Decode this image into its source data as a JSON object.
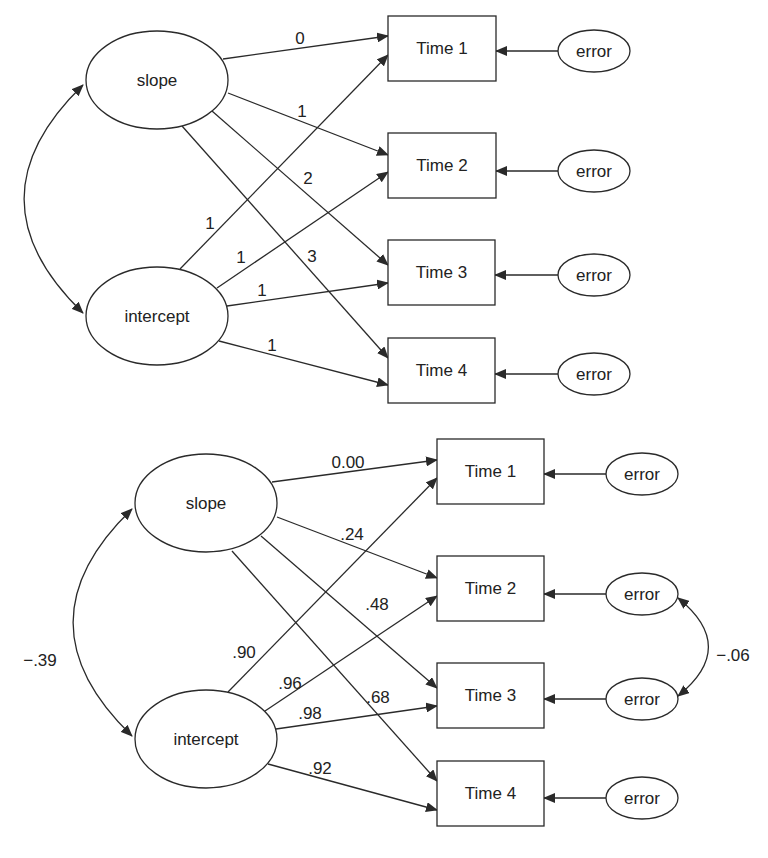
{
  "colors": {
    "stroke": "#2a2a2a",
    "text": "#222222",
    "background": "#ffffff"
  },
  "diagrams": [
    {
      "name": "unstandardized-model",
      "latents": [
        {
          "id": "slope",
          "label": "slope",
          "cx": 157,
          "cy": 80,
          "rx": 71,
          "ry": 49
        },
        {
          "id": "intercept",
          "label": "intercept",
          "cx": 157,
          "cy": 316,
          "rx": 71,
          "ry": 49
        }
      ],
      "observed": [
        {
          "id": "t1",
          "label": "Time 1",
          "x": 388,
          "y": 16,
          "w": 108,
          "h": 65
        },
        {
          "id": "t2",
          "label": "Time 2",
          "x": 388,
          "y": 133,
          "w": 108,
          "h": 65
        },
        {
          "id": "t3",
          "label": "Time 3",
          "x": 388,
          "y": 240,
          "w": 107,
          "h": 65
        },
        {
          "id": "t4",
          "label": "Time 4",
          "x": 388,
          "y": 338,
          "w": 107,
          "h": 65
        }
      ],
      "errors": [
        {
          "label": "error",
          "target": "t1",
          "cx": 594,
          "cy": 51,
          "rx": 36,
          "ry": 21
        },
        {
          "label": "error",
          "target": "t2",
          "cx": 594,
          "cy": 171,
          "rx": 36,
          "ry": 21
        },
        {
          "label": "error",
          "target": "t3",
          "cx": 594,
          "cy": 275,
          "rx": 36,
          "ry": 21
        },
        {
          "label": "error",
          "target": "t4",
          "cx": 594,
          "cy": 374,
          "rx": 36,
          "ry": 21
        }
      ],
      "paths": [
        {
          "from": [
            223,
            59
          ],
          "to": [
            388,
            36
          ],
          "label": "0",
          "lx": 300,
          "ly": 38
        },
        {
          "from": [
            228,
            93
          ],
          "to": [
            388,
            155
          ],
          "label": "1",
          "lx": 302,
          "ly": 111
        },
        {
          "from": [
            212,
            111
          ],
          "to": [
            388,
            265
          ],
          "label": "2",
          "lx": 308,
          "ly": 178
        },
        {
          "from": [
            182,
            126
          ],
          "to": [
            388,
            358
          ],
          "label": "3",
          "lx": 312,
          "ly": 256
        },
        {
          "from": [
            180,
            269
          ],
          "to": [
            388,
            55
          ],
          "label": "1",
          "lx": 210,
          "ly": 223
        },
        {
          "from": [
            217,
            288
          ],
          "to": [
            388,
            172
          ],
          "label": "1",
          "lx": 241,
          "ly": 257
        },
        {
          "from": [
            227,
            306
          ],
          "to": [
            388,
            283
          ],
          "label": "1",
          "lx": 262,
          "ly": 290
        },
        {
          "from": [
            219,
            341
          ],
          "to": [
            388,
            385
          ],
          "label": "1",
          "lx": 272,
          "ly": 345
        }
      ],
      "covariances": [
        {
          "from": [
            83,
            85
          ],
          "to": [
            83,
            313
          ],
          "bulge": -62,
          "label": "",
          "lx": 0,
          "ly": 0
        }
      ]
    },
    {
      "name": "standardized-model",
      "latents": [
        {
          "id": "slope",
          "label": "slope",
          "cx": 206,
          "cy": 503,
          "rx": 71,
          "ry": 49
        },
        {
          "id": "intercept",
          "label": "intercept",
          "cx": 206,
          "cy": 739,
          "rx": 71,
          "ry": 49
        }
      ],
      "observed": [
        {
          "id": "t1",
          "label": "Time 1",
          "x": 437,
          "y": 439,
          "w": 107,
          "h": 65
        },
        {
          "id": "t2",
          "label": "Time 2",
          "x": 437,
          "y": 556,
          "w": 107,
          "h": 65
        },
        {
          "id": "t3",
          "label": "Time 3",
          "x": 437,
          "y": 663,
          "w": 107,
          "h": 65
        },
        {
          "id": "t4",
          "label": "Time 4",
          "x": 437,
          "y": 761,
          "w": 107,
          "h": 65
        }
      ],
      "errors": [
        {
          "label": "error",
          "target": "t1",
          "cx": 642,
          "cy": 474,
          "rx": 36,
          "ry": 21
        },
        {
          "label": "error",
          "target": "t2",
          "cx": 642,
          "cy": 594,
          "rx": 36,
          "ry": 21
        },
        {
          "label": "error",
          "target": "t3",
          "cx": 642,
          "cy": 699,
          "rx": 36,
          "ry": 21
        },
        {
          "label": "error",
          "target": "t4",
          "cx": 642,
          "cy": 798,
          "rx": 36,
          "ry": 21
        }
      ],
      "paths": [
        {
          "from": [
            272,
            482
          ],
          "to": [
            437,
            460
          ],
          "label": "0.00",
          "lx": 348,
          "ly": 462
        },
        {
          "from": [
            277,
            517
          ],
          "to": [
            437,
            578
          ],
          "label": ".24",
          "lx": 352,
          "ly": 534
        },
        {
          "from": [
            261,
            536
          ],
          "to": [
            437,
            688
          ],
          "label": ".48",
          "lx": 377,
          "ly": 604
        },
        {
          "from": [
            232,
            551
          ],
          "to": [
            437,
            781
          ],
          "label": ".68",
          "lx": 378,
          "ly": 697
        },
        {
          "from": [
            228,
            692
          ],
          "to": [
            437,
            478
          ],
          "label": ".90",
          "lx": 244,
          "ly": 652
        },
        {
          "from": [
            265,
            711
          ],
          "to": [
            437,
            596
          ],
          "label": ".96",
          "lx": 290,
          "ly": 683
        },
        {
          "from": [
            276,
            729
          ],
          "to": [
            437,
            706
          ],
          "label": ".98",
          "lx": 310,
          "ly": 713
        },
        {
          "from": [
            268,
            764
          ],
          "to": [
            437,
            810
          ],
          "label": ".92",
          "lx": 320,
          "ly": 768
        }
      ],
      "covariances": [
        {
          "from": [
            132,
            509
          ],
          "to": [
            132,
            736
          ],
          "bulge": -62,
          "label": "−.39",
          "lx": 40,
          "ly": 660
        },
        {
          "from": [
            678,
            598
          ],
          "to": [
            678,
            696
          ],
          "bulge": 32,
          "label": "−.06",
          "lx": 733,
          "ly": 655
        }
      ]
    }
  ]
}
